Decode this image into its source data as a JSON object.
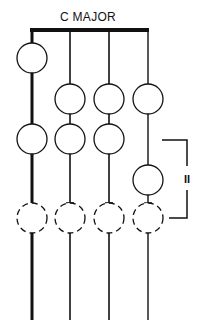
{
  "title": "C MAJOR",
  "bracket_label": "II",
  "colors": {
    "ink": "#111111",
    "background": "#ffffff"
  },
  "strings": [
    {
      "index": 1,
      "x": 32,
      "weight": "heavy"
    },
    {
      "index": 2,
      "x": 70,
      "weight": "light"
    },
    {
      "index": 3,
      "x": 109,
      "weight": "light"
    },
    {
      "index": 4,
      "x": 148,
      "weight": "light"
    }
  ],
  "notes": {
    "solid": [
      {
        "string": 1,
        "row": 1
      },
      {
        "string": 2,
        "row": 2
      },
      {
        "string": 3,
        "row": 2
      },
      {
        "string": 4,
        "row": 2
      },
      {
        "string": 1,
        "row": 3
      },
      {
        "string": 2,
        "row": 3
      },
      {
        "string": 3,
        "row": 3
      },
      {
        "string": 4,
        "row": 4
      }
    ],
    "dashed": [
      {
        "string": 1,
        "row": 5
      },
      {
        "string": 2,
        "row": 5
      },
      {
        "string": 3,
        "row": 5
      },
      {
        "string": 4,
        "row": 5
      }
    ]
  },
  "bracket": {
    "label": "II",
    "spans_rows": [
      3,
      5
    ],
    "side": "right"
  }
}
